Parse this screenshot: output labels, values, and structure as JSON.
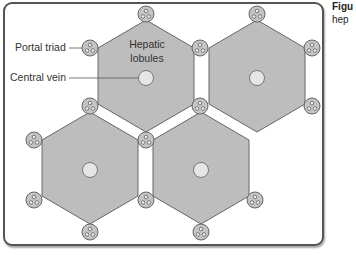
{
  "diagram": {
    "labels": {
      "portal_triad": "Portal triad",
      "central_vein": "Central vein",
      "hepatic_lobules_line1": "Hepatic",
      "hepatic_lobules_line2": "lobules"
    },
    "caption": {
      "line1": "Figu",
      "line2": "hep"
    },
    "colors": {
      "lobule_fill": "#bdbdbd",
      "lobule_stroke": "#666666",
      "vein_fill": "#e6e6e6",
      "triad_fill": "#c4c4c4",
      "frame_stroke": "#555555"
    },
    "lobules": [
      {
        "id": "top-left",
        "cx": 146,
        "cy": 77
      },
      {
        "id": "top-right",
        "cx": 257,
        "cy": 77
      },
      {
        "id": "bottom-left",
        "cx": 90,
        "cy": 170
      },
      {
        "id": "bottom-right",
        "cx": 201,
        "cy": 170
      }
    ]
  }
}
